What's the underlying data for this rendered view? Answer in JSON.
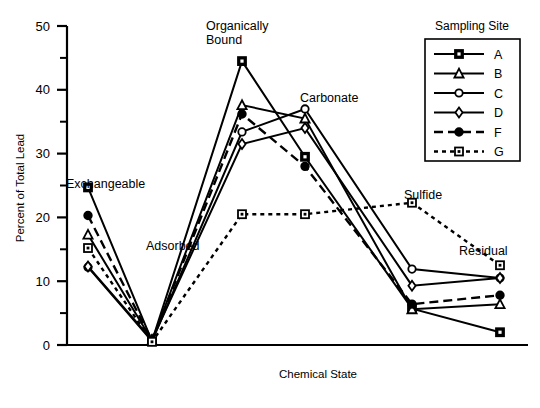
{
  "chart_data": {
    "type": "line",
    "title": "",
    "xlabel": "Chemical State",
    "ylabel": "Percent of Total Lead",
    "ylim": [
      0,
      50
    ],
    "ytick_labels": [
      "0",
      "10",
      "20",
      "30",
      "40",
      "50"
    ],
    "ytick_values": [
      0,
      10,
      20,
      30,
      40,
      50
    ],
    "yminor_values": [
      5,
      15,
      25,
      35,
      45
    ],
    "grid": false,
    "legend_position": "top-right",
    "legend_title": "Sampling Site",
    "categories": [
      "Exchangeable",
      "Adsorbed",
      "Organically Bound",
      "Carbonate",
      "Sulfide",
      "Residual"
    ],
    "category_label_positions": [
      {
        "label": "Exchangeable",
        "x": 66,
        "y": 188
      },
      {
        "label": "Adsorbed",
        "x": 146,
        "y": 250
      },
      {
        "label": "Organically Bound",
        "x": 206,
        "y": 30
      },
      {
        "label": "Carbonate",
        "x": 300,
        "y": 102
      },
      {
        "label": "Sulfide",
        "x": 404,
        "y": 199
      },
      {
        "label": "Residual",
        "x": 459,
        "y": 255
      }
    ],
    "series": [
      {
        "name": "A",
        "marker": "square",
        "dash": "solid",
        "values": [
          24.7,
          0.6,
          44.5,
          29.5,
          5.7,
          2.0
        ]
      },
      {
        "name": "B",
        "marker": "triangle",
        "dash": "solid",
        "values": [
          17.3,
          0.7,
          37.6,
          35.5,
          5.6,
          6.4
        ]
      },
      {
        "name": "C",
        "marker": "circle",
        "dash": "solid",
        "values": [
          12.2,
          0.6,
          33.4,
          37.0,
          11.9,
          10.5
        ]
      },
      {
        "name": "D",
        "marker": "diamond",
        "dash": "solid",
        "values": [
          12.3,
          0.8,
          31.5,
          34.0,
          9.3,
          10.5
        ]
      },
      {
        "name": "F",
        "marker": "filled-circle",
        "dash": "dashed",
        "values": [
          20.3,
          0.7,
          36.2,
          28.0,
          6.4,
          7.8
        ]
      },
      {
        "name": "G",
        "marker": "open-square",
        "dash": "dotted",
        "values": [
          15.2,
          0.5,
          20.5,
          20.5,
          22.3,
          12.5
        ]
      }
    ]
  },
  "legend": {
    "title": "Sampling Site",
    "items": [
      {
        "label": "A",
        "marker": "square",
        "dash": "solid"
      },
      {
        "label": "B",
        "marker": "triangle",
        "dash": "solid"
      },
      {
        "label": "C",
        "marker": "circle",
        "dash": "solid"
      },
      {
        "label": "D",
        "marker": "diamond",
        "dash": "solid"
      },
      {
        "label": "F",
        "marker": "filled-circle",
        "dash": "dashed"
      },
      {
        "label": "G",
        "marker": "open-square",
        "dash": "dotted"
      }
    ]
  },
  "axes": {
    "y_title": "Percent of Total Lead",
    "x_title": "Chemical State"
  },
  "colors": {
    "ink": "#000000",
    "background": "#ffffff"
  }
}
